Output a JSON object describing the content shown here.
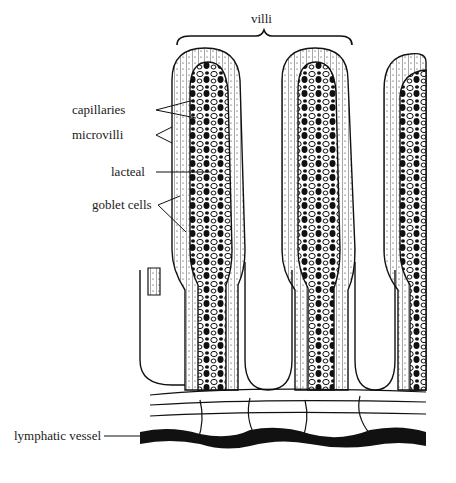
{
  "diagram": {
    "labels": {
      "villi": "villi",
      "capillaries": "capillaries",
      "microvilli": "microvilli",
      "lacteal": "lacteal",
      "goblet_cells": "goblet cells",
      "lymphatic_vessel": "lymphatic vessel"
    },
    "colors": {
      "ink": "#111111",
      "background": "#ffffff"
    }
  }
}
